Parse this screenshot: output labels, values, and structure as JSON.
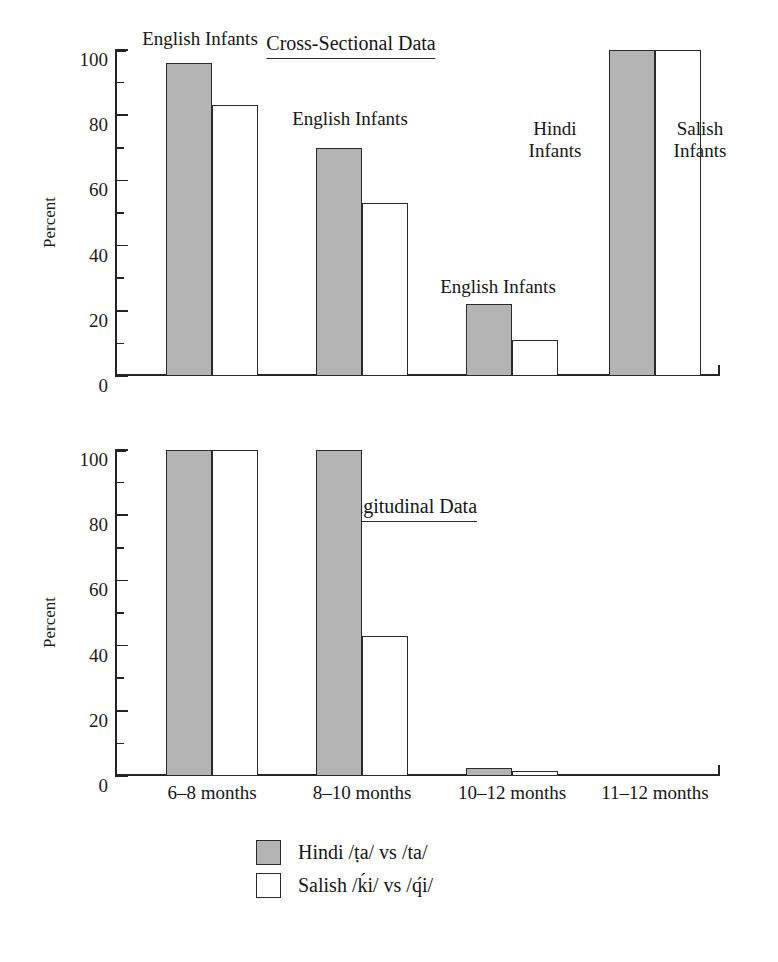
{
  "axis": {
    "ylabel": "Percent",
    "ytick_labels": [
      "0",
      "20",
      "40",
      "60",
      "80",
      "100"
    ],
    "ytick_values": [
      0,
      20,
      40,
      60,
      80,
      100
    ],
    "yminor_values": [
      10,
      30,
      50,
      70,
      90
    ],
    "ylim": [
      0,
      100
    ]
  },
  "panels": [
    {
      "title": "Cross-Sectional Data",
      "annotations": [
        "English Infants",
        "English Infants",
        "English Infants",
        "Hindi\nInfants",
        "Salish\nInfants"
      ]
    },
    {
      "title": "Longitudinal Data",
      "annotations": []
    }
  ],
  "legend": {
    "entries": [
      {
        "swatch": "hindi",
        "label": "Hindi /ṭa/ vs /ta/"
      },
      {
        "swatch": "salish",
        "label": "Salish /ḱi/ vs /q́i/"
      }
    ]
  },
  "colors": {
    "hindi_fill": "#b4b4b4",
    "salish_fill": "#ffffff",
    "stroke": "#2a2a2a",
    "background": "#ffffff"
  },
  "chart_data": [
    {
      "type": "bar",
      "title": "Cross-Sectional Data",
      "xlabel": "",
      "ylabel": "Percent",
      "ylim": [
        0,
        100
      ],
      "grid": false,
      "legend_position": "bottom",
      "categories": [
        "6–8 months",
        "8–10 months",
        "10–12 months",
        "11–12 months"
      ],
      "series": [
        {
          "name": "Hindi /ṭa/ vs /ta/",
          "values": [
            96,
            70,
            22,
            100
          ]
        },
        {
          "name": "Salish /ḱi/ vs /q́i/",
          "values": [
            83,
            53,
            11,
            100
          ]
        }
      ],
      "annotations": [
        {
          "text": "English Infants",
          "group": 0
        },
        {
          "text": "English Infants",
          "group": 1
        },
        {
          "text": "English Infants",
          "group": 2
        },
        {
          "text": "Hindi Infants",
          "group": 3,
          "bar": "hindi"
        },
        {
          "text": "Salish Infants",
          "group": 3,
          "bar": "salish"
        }
      ]
    },
    {
      "type": "bar",
      "title": "Longitudinal Data",
      "xlabel": "",
      "ylabel": "Percent",
      "ylim": [
        0,
        100
      ],
      "grid": false,
      "legend_position": "bottom",
      "categories": [
        "6–8 months",
        "8–10 months",
        "10–12 months",
        "11–12 months"
      ],
      "series": [
        {
          "name": "Hindi /ṭa/ vs /ta/",
          "values": [
            100,
            100,
            2.5,
            0
          ]
        },
        {
          "name": "Salish /ḱi/ vs /q́i/",
          "values": [
            100,
            43,
            1.5,
            0
          ]
        }
      ],
      "annotations": []
    }
  ],
  "xtick_labels": [
    "6–8 months",
    "8–10 months",
    "10–12 months",
    "11–12 months"
  ]
}
